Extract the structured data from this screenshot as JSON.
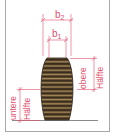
{
  "diagram": {
    "labels": {
      "b2": "b",
      "b2_sub": "2",
      "b1": "b",
      "b1_sub": "1",
      "upper_half_line1": "obere",
      "upper_half_line2": "Hälfte",
      "lower_half_line1": "untere",
      "lower_half_line2": "Hälfte"
    },
    "colors": {
      "dimension": "#e0506e",
      "barrel_dark": "#2e2418",
      "barrel_light": "#a8895a",
      "ground": "#888888",
      "frame": "#a8a8a8"
    }
  }
}
